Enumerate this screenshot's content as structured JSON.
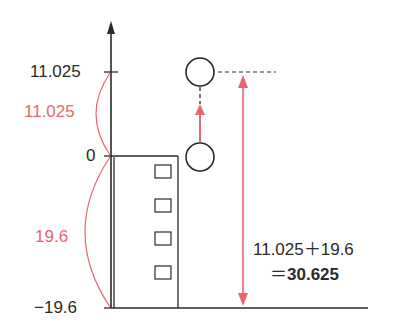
{
  "diagram": {
    "type": "vertical-motion-diagram",
    "axis": {
      "ticks": [
        {
          "label": "11.025",
          "value": 11.025
        },
        {
          "label": "0",
          "value": 0
        },
        {
          "label": "−19.6",
          "value": -19.6
        }
      ]
    },
    "brackets": {
      "upper": {
        "label": "11.025"
      },
      "lower": {
        "label": "19.6"
      }
    },
    "total": {
      "line1": "11.025＋19.6",
      "line2_prefix": "＝",
      "line2_value": "30.625"
    },
    "objects": {
      "building_windows": 4,
      "ball_positions": [
        "top",
        "launch"
      ]
    },
    "colors": {
      "ink": "#2a2a2a",
      "accent_red": "#e8666c"
    }
  }
}
